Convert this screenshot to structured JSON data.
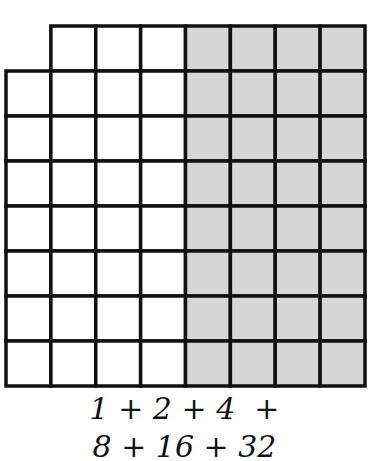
{
  "diagram": {
    "rows": 8,
    "columns": 8,
    "missing_cells": [
      {
        "row": 0,
        "col": 0
      }
    ],
    "shaded_columns": [
      4,
      5,
      6,
      7
    ],
    "colors": {
      "line": "#111111",
      "shade": "#d6d6d6",
      "background": "#ffffff"
    },
    "caption": {
      "line1": "1 + 2 + 4  +",
      "line2": "8 + 16 + 32"
    }
  }
}
